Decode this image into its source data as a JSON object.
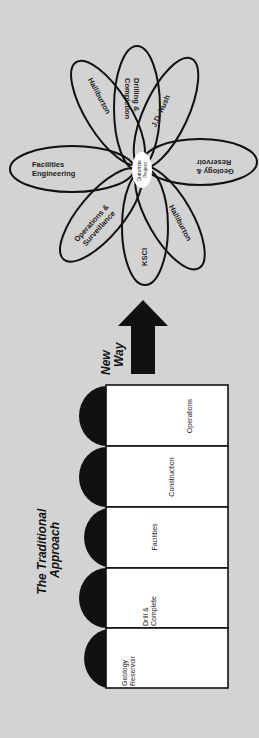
{
  "new_way": {
    "center": {
      "line1": "Diatomite",
      "line2": "Project"
    },
    "petals": [
      {
        "id": "drilling",
        "line1": "Drilling &",
        "line2": "Completion"
      },
      {
        "id": "jdrush",
        "line1": "J.D. Rush",
        "line2": ""
      },
      {
        "id": "geology",
        "line1": "Geology &",
        "line2": "Reservoir"
      },
      {
        "id": "halliburton-lower",
        "line1": "Halliburton",
        "line2": ""
      },
      {
        "id": "ksci",
        "line1": "KSCI",
        "line2": ""
      },
      {
        "id": "operations",
        "line1": "Operations &",
        "line2": "Surveillance"
      },
      {
        "id": "facilities-eng",
        "line1": "Facilities",
        "line2": "Engineering"
      },
      {
        "id": "halliburton-upper",
        "line1": "Halliburton",
        "line2": ""
      }
    ]
  },
  "arrow": {
    "line1": "New",
    "line2": "Way"
  },
  "traditional": {
    "title_line1": "The Traditional",
    "title_line2": "Approach",
    "stages": [
      {
        "line1": "Operations",
        "line2": ""
      },
      {
        "line1": "Construction",
        "line2": ""
      },
      {
        "line1": "Facilities",
        "line2": ""
      },
      {
        "line1": "Drill &",
        "line2": "Complete"
      },
      {
        "line1": "Geology",
        "line2": "Reservoir"
      }
    ]
  },
  "colors": {
    "background": "#d3d3d3",
    "line": "#111111",
    "box_fill": "#ffffff"
  }
}
